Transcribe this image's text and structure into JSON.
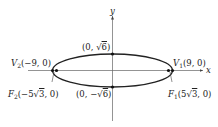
{
  "diagram": {
    "type": "ellipse",
    "equation_semantics": "horizontal ellipse centered at origin, a = 9, b = sqrt(6), c = 5*sqrt(3)",
    "axes": {
      "x_label": "x",
      "y_label": "y"
    },
    "points": {
      "top": {
        "prefix": "(0, ",
        "radical": "6",
        "suffix": ")",
        "sign": ""
      },
      "bottom": {
        "prefix": "(0, ",
        "sign": "−",
        "radical": "6",
        "suffix": ")"
      },
      "v2": {
        "name": "V",
        "sub": "2",
        "coords": "(−9, 0)"
      },
      "v1": {
        "name": "V",
        "sub": "1",
        "coords": "(9, 0)"
      },
      "f2": {
        "name": "F",
        "sub": "2",
        "pre": "(−5",
        "radical": "3",
        "post": ", 0)"
      },
      "f1": {
        "name": "F",
        "sub": "1",
        "pre": "(5",
        "radical": "3",
        "post": ", 0)"
      }
    },
    "colors": {
      "stroke": "#222222",
      "axis": "#555555"
    }
  }
}
